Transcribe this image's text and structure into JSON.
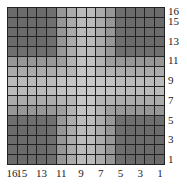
{
  "chart_data": {
    "type": "heatmap",
    "title": "",
    "xlabel": "",
    "ylabel": "",
    "rows": 16,
    "cols": 16,
    "x_tick_labels": [
      "16",
      "15",
      "13",
      "11",
      "9",
      "7",
      "5",
      "3",
      "1"
    ],
    "x_tick_positions": [
      16,
      15,
      13,
      11,
      9,
      7,
      5,
      3,
      1
    ],
    "x_axis_direction": "descending left-to-right",
    "y_tick_labels": [
      "16",
      "15",
      "13",
      "11",
      "9",
      "7",
      "5",
      "3",
      "1"
    ],
    "y_tick_positions": [
      16,
      15,
      13,
      11,
      9,
      7,
      5,
      3,
      1
    ],
    "y_axis_direction": "descending top-to-bottom",
    "y_axis_position": "right",
    "grid": true,
    "pattern": "cross-shaped light band (indices 6-11) on both axes; dark corner blocks (indices 1-5 and 12-16)",
    "color_scale": {
      "dark": "#6b6b6b",
      "medium": "#9c9c9c",
      "light": "#c9c9c9",
      "gridline": "#222222"
    },
    "band_intensity_by_index": {
      "1": 0,
      "2": 0,
      "3": 0,
      "4": 0,
      "5": 0.05,
      "6": 0.55,
      "7": 0.8,
      "8": 1.0,
      "9": 1.0,
      "10": 0.8,
      "11": 0.55,
      "12": 0.05,
      "13": 0,
      "14": 0,
      "15": 0,
      "16": 0
    }
  }
}
